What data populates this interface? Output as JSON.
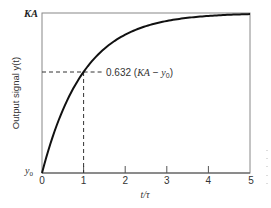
{
  "chart_data": {
    "type": "line",
    "title": "",
    "xlabel": "t/τ",
    "ylabel": "Output signal y(t)",
    "xlim": [
      0,
      5
    ],
    "ylim": [
      "y0",
      "KA"
    ],
    "x_ticks": [
      "0",
      "1",
      "2",
      "3",
      "4",
      "5"
    ],
    "y_tick_labels": {
      "top": "KA",
      "bottom_main": "y",
      "bottom_sub": "0"
    },
    "grid": false,
    "legend": null,
    "series": [
      {
        "name": "first-order step response",
        "formula": "y = y0 + (KA - y0)(1 - e^(-t/τ))",
        "x": [
          0,
          0.5,
          1,
          1.5,
          2,
          2.5,
          3,
          3.5,
          4,
          4.5,
          5
        ],
        "normalized_y": [
          0,
          0.393,
          0.632,
          0.777,
          0.865,
          0.918,
          0.95,
          0.97,
          0.982,
          0.989,
          0.993
        ]
      }
    ],
    "annotations": [
      {
        "text_main": "0.632 (",
        "text_ka": "KA",
        "text_minus": " − ",
        "text_y": "y",
        "text_sub": "0",
        "text_close": ")",
        "x": 1,
        "y_fraction": 0.632,
        "style": "dashed guide lines"
      }
    ]
  }
}
